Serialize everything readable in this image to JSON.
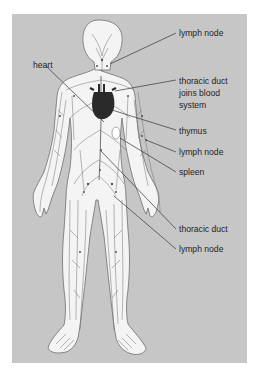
{
  "diagram": {
    "colors": {
      "background": "#ffffff",
      "panel": "#c6c6c6",
      "body_fill": "#f4f4f4",
      "body_outline": "#7a7a7a",
      "vessels": "#6e6e6e",
      "heart": "#2a2a2a",
      "leader_lines": "#333333",
      "label_text": "#1e1e1e"
    },
    "labels": [
      {
        "id": "lymph-node-neck",
        "text": "lymph node",
        "side": "right"
      },
      {
        "id": "heart",
        "text": "heart",
        "side": "left"
      },
      {
        "id": "thoracic-duct-joins",
        "lines": [
          "thoracic duct",
          "joins blood",
          "system"
        ],
        "side": "right"
      },
      {
        "id": "thymus",
        "text": "thymus",
        "side": "right"
      },
      {
        "id": "lymph-node-arm",
        "text": "lymph node",
        "side": "right"
      },
      {
        "id": "spleen",
        "text": "spleen",
        "side": "right"
      },
      {
        "id": "thoracic-duct",
        "text": "thoracic duct",
        "side": "right"
      },
      {
        "id": "lymph-node-groin",
        "text": "lymph node",
        "side": "right"
      }
    ]
  }
}
